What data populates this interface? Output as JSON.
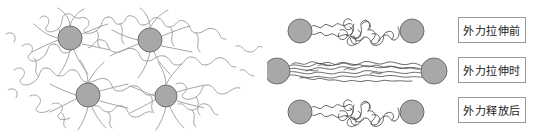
{
  "figure": {
    "title": "",
    "background_color": "#ffffff",
    "width": 534,
    "height": 137
  },
  "colors": {
    "node_fill": "#a8a8a8",
    "node_stroke": "#6e6e6e",
    "network_chain_stroke": "#9b9b9b",
    "bridge_chain_stroke": "#4a4a4a",
    "label_border": "#9a9a9a",
    "label_text": "#1a1a1a",
    "label_background": "#ffffff"
  },
  "left_panel": {
    "name": "crosslinked-polymer-network",
    "description": "random coiled polymer chains crosslinked at filler particles",
    "nodes": [
      {
        "id": "node-top-left",
        "cx": 70,
        "cy": 38,
        "r": 12
      },
      {
        "id": "node-top-right",
        "cx": 150,
        "cy": 40,
        "r": 12
      },
      {
        "id": "node-bottom-left",
        "cx": 88,
        "cy": 95,
        "r": 12
      },
      {
        "id": "node-bottom-right",
        "cx": 166,
        "cy": 96,
        "r": 11
      }
    ]
  },
  "right_panel": {
    "name": "stretch-release-sequence",
    "rows": [
      {
        "id": "row-before",
        "state": "coiled",
        "left_node": {
          "cx": 300,
          "cy": 31,
          "r": 12
        },
        "right_node": {
          "cx": 412,
          "cy": 31,
          "r": 12
        }
      },
      {
        "id": "row-during",
        "state": "stretched",
        "left_node": {
          "cx": 277,
          "cy": 71,
          "r": 13
        },
        "right_node": {
          "cx": 434,
          "cy": 71,
          "r": 13
        }
      },
      {
        "id": "row-after",
        "state": "coiled",
        "left_node": {
          "cx": 300,
          "cy": 112,
          "r": 12
        },
        "right_node": {
          "cx": 412,
          "cy": 112,
          "r": 12
        }
      }
    ]
  },
  "labels": {
    "before": "外力拉伸前",
    "during": "外力拉伸时",
    "after": "外力释放后"
  }
}
